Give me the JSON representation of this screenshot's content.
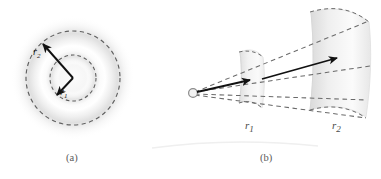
{
  "figure": {
    "background_color": "#ffffff",
    "panels": [
      {
        "id": "panel-a",
        "caption": "(a)",
        "kind": "concentric-circles-diagram",
        "description": "Point source at center with two concentric dashed circles of radii r1 and r2, and radial arrows labeled r1 and r2",
        "center": {
          "x": 73,
          "y": 78
        },
        "circles": [
          {
            "name": "inner-dashed-circle",
            "radius": 23,
            "label": "r1"
          },
          {
            "name": "outer-dashed-circle",
            "radius": 47,
            "label": "r2"
          }
        ],
        "arrows": [
          {
            "name": "arrow-r1",
            "label": "r",
            "sub": "1",
            "from": {
              "x": 73,
              "y": 78
            },
            "to": {
              "x": 56,
              "y": 96
            }
          },
          {
            "name": "arrow-r2",
            "label": "r",
            "sub": "2",
            "from": {
              "x": 73,
              "y": 78
            },
            "to": {
              "x": 41,
              "y": 42
            }
          }
        ],
        "labels": [
          {
            "name": "label-r1",
            "text": "r",
            "sub": "1",
            "x": 62,
            "y": 92
          },
          {
            "name": "label-r2",
            "text": "r",
            "sub": "2",
            "x": 38,
            "y": 52
          }
        ]
      },
      {
        "id": "panel-b",
        "caption": "(b)",
        "kind": "cone-solid-angle-diagram",
        "description": "Point source at apex emitting a cone; two spherical cap cross-sections at distances r1 and r2 with flux arrows",
        "apex": {
          "x": 194,
          "y": 93
        },
        "caps": [
          {
            "name": "near-spherical-cap",
            "label": "r1",
            "distance_label_x": 250,
            "distance_label_y": 127
          },
          {
            "name": "far-spherical-cap",
            "label": "r2",
            "distance_label_x": 337,
            "distance_label_y": 127
          }
        ],
        "arrows": [
          {
            "name": "arrow-to-near-cap",
            "from": {
              "x": 194,
              "y": 93
            },
            "to": {
              "x": 250,
              "y": 80
            }
          },
          {
            "name": "arrow-to-far-cap",
            "from": {
              "x": 262,
              "y": 78
            },
            "to": {
              "x": 337,
              "y": 58
            }
          }
        ],
        "labels": [
          {
            "name": "label-r1-b",
            "text": "r",
            "sub": "1",
            "x": 246,
            "y": 120
          },
          {
            "name": "label-r2-b",
            "text": "r",
            "sub": "2",
            "x": 333,
            "y": 120
          }
        ]
      }
    ],
    "captions": [
      {
        "name": "caption-a",
        "text": "(a)",
        "x": 68,
        "y": 155
      },
      {
        "name": "caption-b",
        "text": "(b)",
        "x": 262,
        "y": 155
      }
    ],
    "colors": {
      "dashed_stroke": "#5f5f5f",
      "arrow_stroke": "#111111",
      "glow_fill": "#e9e9e9",
      "cap_fill": "#f0f0f0",
      "cap_edge": "#d8d8d8",
      "caption_text": "#5a5a5a",
      "label_text": "#1a1a1a"
    }
  }
}
